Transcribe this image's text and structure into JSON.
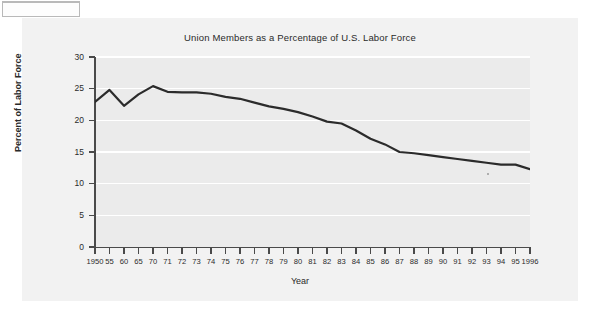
{
  "figure": {
    "title": "Union Members as a Percentage of U.S. Labor Force",
    "xlabel": "Year",
    "ylabel": "Percent of Labor Force"
  },
  "axes": {
    "y_ticks": [
      "0",
      "5",
      "10",
      "15",
      "20",
      "25",
      "30"
    ],
    "x_tick_labels": [
      "1950",
      "55",
      "60",
      "65",
      "70",
      "71",
      "72",
      "73",
      "74",
      "75",
      "76",
      "77",
      "78",
      "79",
      "80",
      "81",
      "82",
      "83",
      "84",
      "85",
      "86",
      "87",
      "88",
      "89",
      "90",
      "91",
      "92",
      "93",
      "94",
      "95",
      "1996"
    ]
  },
  "style": {
    "line_color": "#2b2b2b",
    "plot_background": "#ebebeb",
    "panel_background": "#f2f2f2",
    "gridline_color": "#ffffff",
    "axis_color": "#4a4a4a"
  },
  "chart_data": {
    "type": "line",
    "title": "Union Members as a Percentage of U.S. Labor Force",
    "xlabel": "Year",
    "ylabel": "Percent of Labor Force",
    "ylim": [
      0,
      30
    ],
    "yticks": [
      0,
      5,
      10,
      15,
      20,
      25,
      30
    ],
    "grid": true,
    "legend": null,
    "x": [
      1950,
      1955,
      1960,
      1965,
      1970,
      1971,
      1972,
      1973,
      1974,
      1975,
      1976,
      1977,
      1978,
      1979,
      1980,
      1981,
      1982,
      1983,
      1984,
      1985,
      1986,
      1987,
      1988,
      1989,
      1990,
      1991,
      1992,
      1993,
      1994,
      1995,
      1996
    ],
    "xtick_labels": [
      "1950",
      "55",
      "60",
      "65",
      "70",
      "71",
      "72",
      "73",
      "74",
      "75",
      "76",
      "77",
      "78",
      "79",
      "80",
      "81",
      "82",
      "83",
      "84",
      "85",
      "86",
      "87",
      "88",
      "89",
      "90",
      "91",
      "92",
      "93",
      "94",
      "95",
      "1996"
    ],
    "series": [
      {
        "name": "Union members as percent of U.S. labor force",
        "values": [
          22.9,
          24.8,
          22.3,
          24.1,
          25.4,
          24.5,
          24.4,
          24.4,
          24.2,
          23.7,
          23.4,
          22.8,
          22.2,
          21.8,
          21.3,
          20.6,
          19.8,
          19.5,
          18.4,
          17.1,
          16.2,
          15.0,
          14.8,
          14.5,
          14.2,
          13.9,
          13.6,
          13.3,
          13.0,
          13.0,
          12.3
        ]
      }
    ]
  }
}
